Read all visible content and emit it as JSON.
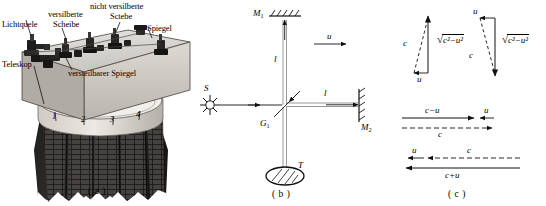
{
  "figure": {
    "panels": [
      {
        "id": "a",
        "caption": "( a )"
      },
      {
        "id": "b",
        "caption": "( b )"
      },
      {
        "id": "c",
        "caption": "( c )"
      }
    ]
  },
  "panel_a": {
    "caption": "( a )",
    "labels": {
      "light_source": "Lichtquele",
      "silvered_plate_l1": "versilberte",
      "silvered_plate_l2": "Scheibe",
      "unsilvered_plate_l1": "nicht versilberte",
      "unsilvered_plate_l2": "Sctebe",
      "mirror": "Spiegel",
      "telescope": "Teleskop",
      "adjustable_mirror": "versteilbarer Spiegel"
    },
    "scale_numbers": [
      "1",
      "2",
      "3",
      "4"
    ]
  },
  "panel_b": {
    "caption": "( b )",
    "labels": {
      "mirror_1": "M",
      "mirror_1_sub": "1",
      "mirror_2": "M",
      "mirror_2_sub": "2",
      "beam_splitter": "G",
      "beam_splitter_sub": "1",
      "source": "S",
      "telescope": "T",
      "arm_vertical": "l",
      "arm_horizontal": "l",
      "velocity": "u"
    }
  },
  "panel_c": {
    "caption": "( c )",
    "triangle_left": {
      "hypotenuse": "c",
      "base": "u",
      "vertical": "c",
      "vertical_sup": "2",
      "vertical_minus": "−",
      "vertical_u": "u",
      "vertical_u_sup": "2",
      "vertical_expr": "c²−u²"
    },
    "triangle_right": {
      "hypotenuse": "c",
      "top": "u",
      "vertical_expr": "c²−u²"
    },
    "lines_top": {
      "solid_label": "c−u",
      "u_label": "u",
      "dashed_label": "c"
    },
    "lines_bottom": {
      "u_label": "u",
      "dashed_label": "c",
      "solid_label": "c+u"
    }
  },
  "colors": {
    "ink": "#111111",
    "photo_light": "#d8d6d2",
    "photo_mid": "#9a9792",
    "photo_dark": "#2b2b2b"
  }
}
